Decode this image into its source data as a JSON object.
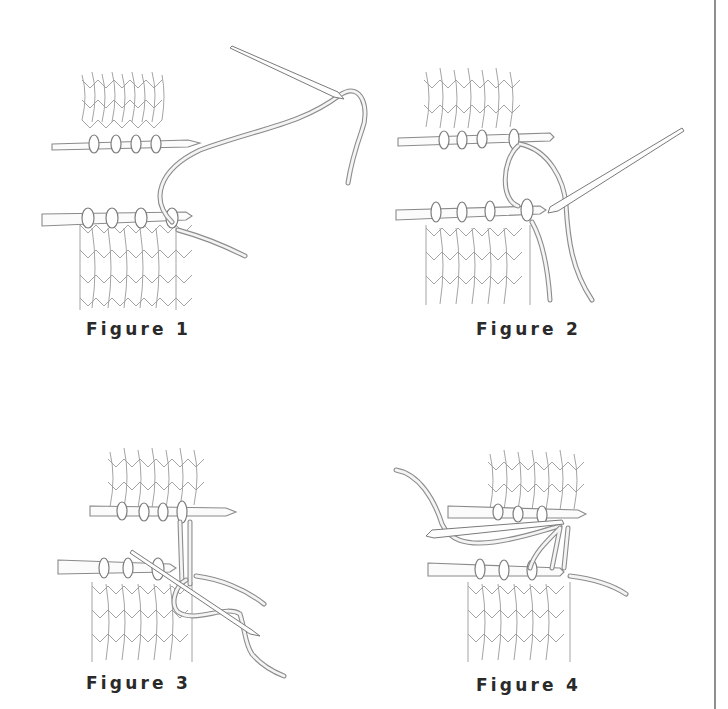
{
  "document": {
    "subject": "Knitting grafting (Kitchener stitch) illustration",
    "figures": [
      {
        "id": 1,
        "caption": "Figure 1"
      },
      {
        "id": 2,
        "caption": "Figure 2"
      },
      {
        "id": 3,
        "caption": "Figure 3"
      },
      {
        "id": 4,
        "caption": "Figure 4"
      }
    ]
  },
  "colors": {
    "background": "#ffffff",
    "line_art": "#8c8c8c",
    "caption_text": "#2a2a2a",
    "border_rule": "#8f8f8f"
  }
}
